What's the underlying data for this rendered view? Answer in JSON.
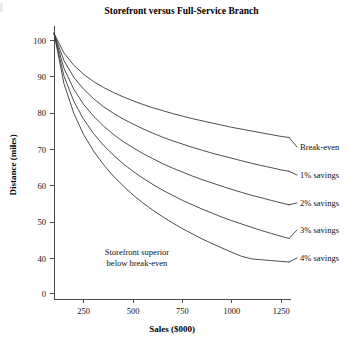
{
  "chart_data": {
    "type": "line",
    "title": "Storefront versus Full-Service Branch",
    "xlabel": "Sales ($000)",
    "ylabel": "Distance (miles)",
    "xlim": [
      100,
      1300
    ],
    "ylim": [
      0,
      105
    ],
    "xticks": [
      250,
      500,
      750,
      1000,
      1250
    ],
    "xtick_labels": [
      "250",
      "500",
      "750",
      "1000",
      "1250"
    ],
    "yticks": [
      0,
      40,
      50,
      60,
      70,
      80,
      90,
      100
    ],
    "ytick_labels": [
      "0",
      "40",
      "50",
      "60",
      "70",
      "80",
      "90",
      "100"
    ],
    "y_axis_break": "Axis compressed between 0 and 40; ticks 10, 20, 30 omitted",
    "grid": false,
    "legend": "inline-right-labels",
    "annotations": [
      {
        "name": "storefront-superior-note",
        "lines": [
          "Storefront superior",
          "below break-even"
        ],
        "x": 520,
        "y": 41
      }
    ],
    "x": [
      100,
      150,
      200,
      250,
      300,
      350,
      400,
      450,
      500,
      550,
      600,
      650,
      700,
      750,
      800,
      850,
      900,
      950,
      1000,
      1050,
      1100,
      1150,
      1200,
      1250,
      1290
    ],
    "series": [
      {
        "name": "Break-even",
        "label": "Break-even",
        "values": [
          102.0,
          96.6,
          93.2,
          90.7,
          88.7,
          87.1,
          85.7,
          84.5,
          83.4,
          82.4,
          81.5,
          80.7,
          79.9,
          79.2,
          78.5,
          77.9,
          77.3,
          76.7,
          76.1,
          75.6,
          75.1,
          74.6,
          74.1,
          73.6,
          73.3
        ]
      },
      {
        "name": "1% savings",
        "label": "1% savings",
        "values": [
          102.0,
          94.5,
          89.9,
          86.6,
          84.0,
          81.8,
          80.0,
          78.4,
          77.0,
          75.7,
          74.5,
          73.4,
          72.4,
          71.5,
          70.6,
          69.8,
          69.0,
          68.3,
          67.6,
          66.9,
          66.2,
          65.6,
          65.0,
          64.4,
          64.0
        ]
      },
      {
        "name": "2% savings",
        "label": "2% savings",
        "values": [
          102.0,
          92.4,
          86.6,
          82.4,
          79.2,
          76.5,
          74.2,
          72.2,
          70.5,
          68.9,
          67.5,
          66.1,
          64.9,
          63.8,
          62.7,
          61.7,
          60.8,
          59.9,
          59.0,
          58.2,
          57.4,
          56.7,
          56.0,
          55.3,
          54.8
        ]
      },
      {
        "name": "3% savings",
        "label": "3% savings",
        "values": [
          102.0,
          90.3,
          83.3,
          78.3,
          74.4,
          71.2,
          68.5,
          66.1,
          64.0,
          62.1,
          60.4,
          58.8,
          57.4,
          56.0,
          54.8,
          53.6,
          52.5,
          51.4,
          50.4,
          49.5,
          48.6,
          47.7,
          46.9,
          46.1,
          45.5
        ]
      },
      {
        "name": "4% savings",
        "label": "4% savings",
        "values": [
          102.0,
          88.2,
          80.0,
          74.1,
          69.6,
          65.9,
          62.7,
          60.0,
          57.5,
          55.3,
          53.3,
          51.5,
          49.8,
          48.2,
          46.8,
          45.4,
          44.1,
          42.9,
          41.7,
          40.6,
          39.6,
          38.6,
          37.6,
          36.7,
          36.0
        ]
      }
    ],
    "series_label_positions": [
      {
        "label": "Break-even",
        "y_px": 150
      },
      {
        "label": "1% savings",
        "y_px": 178
      },
      {
        "label": "2% savings",
        "y_px": 206
      },
      {
        "label": "3% savings",
        "y_px": 233
      },
      {
        "label": "4% savings",
        "y_px": 261
      }
    ],
    "colors": {
      "curve": "#3a3a3a",
      "axis": "#4a4a4a",
      "text": "#111111",
      "background": "#ffffff"
    }
  }
}
